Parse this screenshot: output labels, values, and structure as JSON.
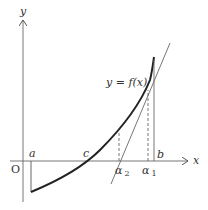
{
  "diagram": {
    "type": "function-graph-newton-method",
    "axes": {
      "x_label": "x",
      "y_label": "y",
      "origin_label": "O"
    },
    "curve_label": "y = f(x)",
    "points": {
      "a": "a",
      "b": "b",
      "c": "c",
      "alpha1": "α",
      "alpha1_sub": "1",
      "alpha2": "α",
      "alpha2_sub": "2"
    },
    "colors": {
      "axis": "#555555",
      "curve": "#222222",
      "tangent": "#666666",
      "text": "#333333"
    }
  }
}
